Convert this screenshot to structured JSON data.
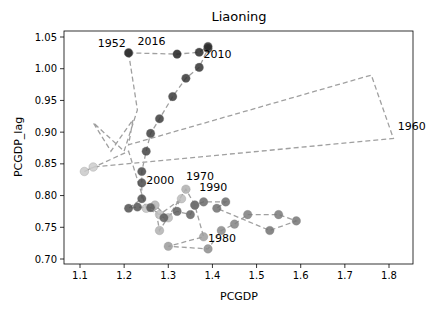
{
  "chart_data": {
    "type": "scatter",
    "title": "Liaoning",
    "xlabel": "PCGDP",
    "ylabel": "PCGDP_lag",
    "xlim": [
      1.07,
      1.86
    ],
    "ylim": [
      0.695,
      1.06
    ],
    "xticks": [
      "1.1",
      "1.2",
      "1.3",
      "1.4",
      "1.5",
      "1.6",
      "1.7",
      "1.8"
    ],
    "yticks": [
      "0.70",
      "0.75",
      "0.80",
      "0.85",
      "0.90",
      "0.95",
      "1.00",
      "1.05"
    ],
    "grid": false,
    "legend": "none",
    "connected_path": "dashed grey line connecting consecutive years; marker shade darkens with year",
    "series": [
      {
        "name": "Liaoning yearly (PCGDP, PCGDP_lag)",
        "points": [
          {
            "year": 1952,
            "x": 1.21,
            "y": 1.025
          },
          {
            "year": 1953,
            "x": 1.23,
            "y": 0.935
          },
          {
            "year": 1954,
            "x": 1.2,
            "y": 0.87
          },
          {
            "year": 1955,
            "x": 1.13,
            "y": 0.915
          },
          {
            "year": 1956,
            "x": 1.17,
            "y": 0.87
          },
          {
            "year": 1957,
            "x": 1.22,
            "y": 0.92
          },
          {
            "year": 1958,
            "x": 1.21,
            "y": 0.88
          },
          {
            "year": 1959,
            "x": 1.76,
            "y": 0.99
          },
          {
            "year": 1960,
            "x": 1.81,
            "y": 0.89
          },
          {
            "year": 1961,
            "x": 1.13,
            "y": 0.845
          },
          {
            "year": 1962,
            "x": 1.11,
            "y": 0.838
          },
          {
            "year": 1963,
            "x": 1.21,
            "y": 0.87
          },
          {
            "year": 1964,
            "x": 1.25,
            "y": 0.78
          },
          {
            "year": 1965,
            "x": 1.28,
            "y": 0.77
          },
          {
            "year": 1966,
            "x": 1.33,
            "y": 0.795
          },
          {
            "year": 1967,
            "x": 1.3,
            "y": 0.765
          },
          {
            "year": 1968,
            "x": 1.27,
            "y": 0.785
          },
          {
            "year": 1969,
            "x": 1.28,
            "y": 0.745
          },
          {
            "year": 1970,
            "x": 1.34,
            "y": 0.81
          },
          {
            "year": 1971,
            "x": 1.36,
            "y": 0.785
          },
          {
            "year": 1975,
            "x": 1.38,
            "y": 0.735
          },
          {
            "year": 1976,
            "x": 1.3,
            "y": 0.72
          },
          {
            "year": 1980,
            "x": 1.39,
            "y": 0.716
          },
          {
            "year": 1981,
            "x": 1.42,
            "y": 0.745
          },
          {
            "year": 1983,
            "x": 1.45,
            "y": 0.755
          },
          {
            "year": 1985,
            "x": 1.48,
            "y": 0.77
          },
          {
            "year": 1986,
            "x": 1.55,
            "y": 0.77
          },
          {
            "year": 1987,
            "x": 1.59,
            "y": 0.76
          },
          {
            "year": 1988,
            "x": 1.53,
            "y": 0.745
          },
          {
            "year": 1989,
            "x": 1.41,
            "y": 0.78
          },
          {
            "year": 1990,
            "x": 1.43,
            "y": 0.79
          },
          {
            "year": 1991,
            "x": 1.38,
            "y": 0.79
          },
          {
            "year": 1992,
            "x": 1.36,
            "y": 0.785
          },
          {
            "year": 1993,
            "x": 1.35,
            "y": 0.77
          },
          {
            "year": 1994,
            "x": 1.32,
            "y": 0.775
          },
          {
            "year": 1995,
            "x": 1.29,
            "y": 0.765
          },
          {
            "year": 1996,
            "x": 1.26,
            "y": 0.781
          },
          {
            "year": 1997,
            "x": 1.23,
            "y": 0.782
          },
          {
            "year": 1998,
            "x": 1.21,
            "y": 0.78
          },
          {
            "year": 1999,
            "x": 1.24,
            "y": 0.795
          },
          {
            "year": 2000,
            "x": 1.24,
            "y": 0.82
          },
          {
            "year": 2001,
            "x": 1.24,
            "y": 0.838
          },
          {
            "year": 2002,
            "x": 1.25,
            "y": 0.87
          },
          {
            "year": 2003,
            "x": 1.26,
            "y": 0.898
          },
          {
            "year": 2004,
            "x": 1.28,
            "y": 0.921
          },
          {
            "year": 2005,
            "x": 1.31,
            "y": 0.956
          },
          {
            "year": 2006,
            "x": 1.34,
            "y": 0.985
          },
          {
            "year": 2007,
            "x": 1.37,
            "y": 1.002
          },
          {
            "year": 2008,
            "x": 1.39,
            "y": 1.032
          },
          {
            "year": 2009,
            "x": 1.39,
            "y": 1.035
          },
          {
            "year": 2010,
            "x": 1.37,
            "y": 1.026
          },
          {
            "year": 2012,
            "x": 1.32,
            "y": 1.023
          },
          {
            "year": 2016,
            "x": 1.21,
            "y": 1.025
          }
        ]
      }
    ],
    "annotations": [
      {
        "text": "1952",
        "x": 1.14,
        "y": 1.035
      },
      {
        "text": "2016",
        "x": 1.23,
        "y": 1.038
      },
      {
        "text": "2010",
        "x": 1.38,
        "y": 1.017
      },
      {
        "text": "1960",
        "x": 1.82,
        "y": 0.903
      },
      {
        "text": "2000",
        "x": 1.25,
        "y": 0.818
      },
      {
        "text": "1970",
        "x": 1.34,
        "y": 0.825
      },
      {
        "text": "1990",
        "x": 1.37,
        "y": 0.808
      },
      {
        "text": "1980",
        "x": 1.39,
        "y": 0.727
      }
    ]
  }
}
